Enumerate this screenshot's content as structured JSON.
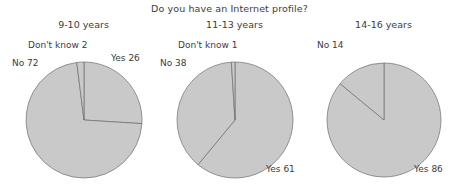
{
  "chart_data": {
    "type": "pie",
    "title": "Do you have an Internet profile?",
    "legend_position": "none",
    "grid": false,
    "panels": [
      {
        "title": "9-10 years",
        "categories": [
          "Yes",
          "No",
          "Don't know"
        ],
        "values": [
          26,
          72,
          2
        ],
        "labels": [
          "Yes 26",
          "No 72",
          "Don't know 2"
        ]
      },
      {
        "title": "11-13 years",
        "categories": [
          "Yes",
          "No",
          "Don't know"
        ],
        "values": [
          61,
          38,
          1
        ],
        "labels": [
          "Yes 61",
          "No 38",
          "Don't know 1"
        ]
      },
      {
        "title": "14-16 years",
        "categories": [
          "Yes",
          "No"
        ],
        "values": [
          86,
          14
        ],
        "labels": [
          "Yes 86",
          "No 14"
        ]
      }
    ],
    "colors": {
      "slice_fill": "#c9c9c9",
      "slice_stroke": "#6f6f6f",
      "text": "#3c3c3c",
      "background": "#ffffff"
    }
  },
  "figure": {
    "title": "Do you have an Internet profile?",
    "panel1": {
      "title": "9-10 years",
      "label_yes": "Yes 26",
      "label_no": "No 72",
      "label_dk": "Don't know 2"
    },
    "panel2": {
      "title": "11-13 years",
      "label_yes": "Yes 61",
      "label_no": "No 38",
      "label_dk": "Don't know 1"
    },
    "panel3": {
      "title": "14-16 years",
      "label_yes": "Yes 86",
      "label_no": "No 14"
    }
  }
}
